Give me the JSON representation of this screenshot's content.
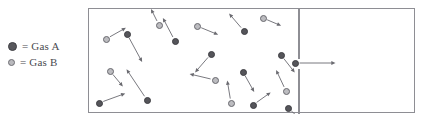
{
  "figure": {
    "type": "gas-effusion-diagram"
  },
  "legend": {
    "items": [
      {
        "symbol": "filled-dot",
        "equals": "=",
        "label": "Gas A",
        "color": "#58585c"
      },
      {
        "symbol": "open-dot",
        "equals": "=",
        "label": "Gas B",
        "color": "#b9b9bd"
      }
    ]
  },
  "colors": {
    "border": "#8e8e94",
    "gas_a": "#55555a",
    "gas_b": "#bcbcc0",
    "gas_b_ring": "#68686e",
    "arrow": "#6a6a70",
    "background": "#ffffff"
  },
  "chamber": {
    "left_chamber_label": "gas-filled chamber",
    "right_chamber_label": "empty chamber",
    "divider_x": 209,
    "opening_top": 50,
    "opening_bottom": 60,
    "width": 327,
    "height": 105
  },
  "particles": [
    {
      "id": 1,
      "gas": "A",
      "x": 38,
      "y": 25,
      "vx": 13,
      "vy": 24
    },
    {
      "id": 2,
      "gas": "B",
      "x": 17,
      "y": 30,
      "vx": 16,
      "vy": -9
    },
    {
      "id": 3,
      "gas": "B",
      "x": 70,
      "y": 16,
      "vx": -6,
      "vy": -12
    },
    {
      "id": 4,
      "gas": "B",
      "x": 21,
      "y": 62,
      "vx": 10,
      "vy": 12
    },
    {
      "id": 5,
      "gas": "A",
      "x": 10,
      "y": 94,
      "vx": 22,
      "vy": -8
    },
    {
      "id": 6,
      "gas": "A",
      "x": 58,
      "y": 91,
      "vx": -18,
      "vy": -27
    },
    {
      "id": 7,
      "gas": "A",
      "x": 86,
      "y": 32,
      "vx": -10,
      "vy": -19
    },
    {
      "id": 8,
      "gas": "B",
      "x": 108,
      "y": 17,
      "vx": 17,
      "vy": 7
    },
    {
      "id": 9,
      "gas": "A",
      "x": 122,
      "y": 45,
      "vx": -13,
      "vy": 15
    },
    {
      "id": 10,
      "gas": "A",
      "x": 155,
      "y": 22,
      "vx": -12,
      "vy": -14
    },
    {
      "id": 11,
      "gas": "B",
      "x": 174,
      "y": 9,
      "vx": 14,
      "vy": 6
    },
    {
      "id": 12,
      "gas": "B",
      "x": 126,
      "y": 71,
      "vx": -21,
      "vy": -5
    },
    {
      "id": 13,
      "gas": "A",
      "x": 154,
      "y": 63,
      "vx": 9,
      "vy": 16
    },
    {
      "id": 14,
      "gas": "B",
      "x": 142,
      "y": 94,
      "vx": -3,
      "vy": -18
    },
    {
      "id": 15,
      "gas": "A",
      "x": 164,
      "y": 96,
      "vx": 14,
      "vy": -10
    },
    {
      "id": 16,
      "gas": "B",
      "x": 197,
      "y": 82,
      "vx": -8,
      "vy": -17
    },
    {
      "id": 17,
      "gas": "A",
      "x": 192,
      "y": 46,
      "vx": 11,
      "vy": 14
    },
    {
      "id": 18,
      "gas": "A",
      "x": 199,
      "y": 99,
      "vx": 10,
      "vy": 9
    },
    {
      "id": 19,
      "gas": "A",
      "x": 206,
      "y": 54,
      "vx": 36,
      "vy": 0
    }
  ]
}
